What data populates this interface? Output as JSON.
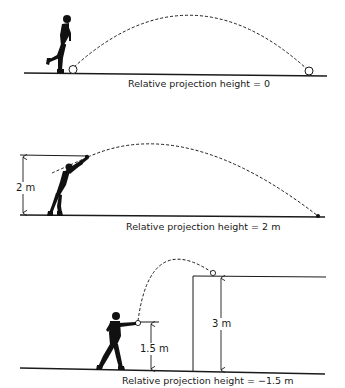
{
  "panels": [
    {
      "id": "panel-1",
      "caption": "Relative projection height = 0",
      "dimensions": []
    },
    {
      "id": "panel-2",
      "caption": "Relative projection height = 2 m",
      "dimensions": [
        {
          "label": "2 m"
        }
      ]
    },
    {
      "id": "panel-3",
      "caption": "Relative projection height = −1.5 m",
      "dimensions": [
        {
          "label": "1.5 m"
        },
        {
          "label": "3 m"
        }
      ]
    }
  ],
  "colors": {
    "ink": "#1a1a1a",
    "background": "#ffffff"
  }
}
